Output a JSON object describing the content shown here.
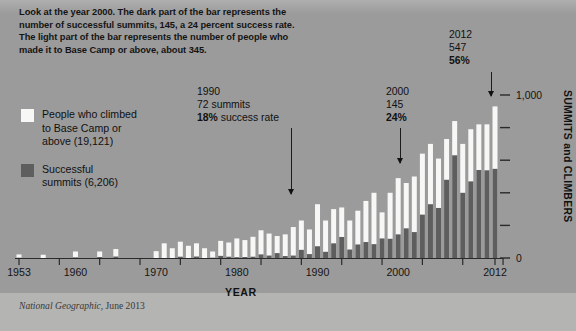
{
  "caption": {
    "lines": [
      "Look at the year 2000. The dark part of the bar represents the",
      "number of successful summits, 145, a 24 percent success rate.",
      "The light part of the bar represents the number of people who",
      "made it to Base Camp or above, about 345."
    ]
  },
  "legend": [
    {
      "swatch": "light",
      "lines": [
        "People who climbed",
        "to Base Camp or",
        "above (19,121)"
      ]
    },
    {
      "swatch": "dark",
      "lines": [
        "Successful",
        "summits (6,206)"
      ]
    }
  ],
  "annotations": [
    {
      "year": "1990",
      "value": "72 summits",
      "rate": "18%",
      "rate_suffix": " success rate"
    },
    {
      "year": "2000",
      "value": "145",
      "rate": "24%",
      "rate_suffix": ""
    },
    {
      "year": "2012",
      "value": "547",
      "rate": "56%",
      "rate_suffix": ""
    }
  ],
  "axes": {
    "xlabel": "YEAR",
    "ylabel": "SUMMITS and CLIMBERS",
    "xticks": [
      "1953",
      "1960",
      "1970",
      "1980",
      "1990",
      "2000",
      "2012"
    ],
    "yticks": [
      "0",
      "1,000"
    ]
  },
  "source": {
    "publication": "National Geographic",
    "date": ", June 2013"
  },
  "colors": {
    "background": "#9b9b9b",
    "footer": "#b4b4b2",
    "bar_light": "#f7f7f5",
    "bar_dark": "#5e5e5e",
    "axis": "#2a2a2a",
    "text": "#141414"
  },
  "chart_data": {
    "type": "bar",
    "xlabel": "YEAR",
    "ylabel": "SUMMITS and CLIMBERS",
    "ylim": [
      0,
      1000
    ],
    "ytick_values": [
      0,
      200,
      400,
      600,
      800,
      1000
    ],
    "ytick_labels": [
      "0",
      "",
      "",
      "",
      "",
      "1,000"
    ],
    "stacked": true,
    "grid": false,
    "legend_position": "upper-left",
    "x": [
      1953,
      1954,
      1955,
      1956,
      1957,
      1958,
      1959,
      1960,
      1961,
      1962,
      1963,
      1964,
      1965,
      1966,
      1967,
      1968,
      1969,
      1970,
      1971,
      1972,
      1973,
      1974,
      1975,
      1976,
      1977,
      1978,
      1979,
      1980,
      1981,
      1982,
      1983,
      1984,
      1985,
      1986,
      1987,
      1988,
      1989,
      1990,
      1991,
      1992,
      1993,
      1994,
      1995,
      1996,
      1997,
      1998,
      1999,
      2000,
      2001,
      2002,
      2003,
      2004,
      2005,
      2006,
      2007,
      2008,
      2009,
      2010,
      2011,
      2012
    ],
    "series": [
      {
        "name": "People who climbed to Base Camp or above (19,121)",
        "color": "#f7f7f5",
        "total": 19121,
        "values": [
          22,
          0,
          0,
          20,
          0,
          0,
          0,
          40,
          0,
          0,
          40,
          0,
          55,
          0,
          0,
          0,
          0,
          42,
          90,
          60,
          100,
          75,
          90,
          60,
          40,
          105,
          95,
          120,
          110,
          130,
          170,
          150,
          135,
          145,
          190,
          230,
          175,
          330,
          230,
          300,
          310,
          230,
          290,
          350,
          400,
          280,
          400,
          490,
          460,
          500,
          640,
          700,
          610,
          730,
          840,
          700,
          790,
          820,
          820,
          930
        ]
      },
      {
        "name": "Successful summits (6,206)",
        "color": "#5e5e5e",
        "total": 6206,
        "values": [
          2,
          0,
          0,
          0,
          0,
          0,
          0,
          4,
          0,
          0,
          6,
          0,
          9,
          0,
          0,
          0,
          0,
          0,
          0,
          0,
          8,
          0,
          9,
          0,
          2,
          13,
          8,
          5,
          6,
          8,
          22,
          15,
          30,
          12,
          15,
          50,
          24,
          72,
          38,
          90,
          129,
          52,
          83,
          98,
          85,
          120,
          118,
          145,
          182,
          159,
          266,
          330,
          307,
          480,
          630,
          400,
          470,
          540,
          538,
          547
        ]
      }
    ],
    "annotated_points": [
      {
        "year": 1990,
        "summits": 72,
        "success_rate_pct": 18
      },
      {
        "year": 2000,
        "summits": 145,
        "climbers": 345,
        "success_rate_pct": 24
      },
      {
        "year": 2012,
        "summits": 547,
        "success_rate_pct": 56
      }
    ]
  }
}
